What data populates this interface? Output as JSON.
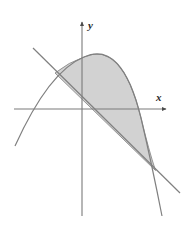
{
  "figure": {
    "background_color": "#ffffff",
    "axes": {
      "x_axis": {
        "label": "x",
        "label_position": {
          "x": 158,
          "y": 100
        },
        "start": {
          "x": 14,
          "y": 109
        },
        "end": {
          "x": 170,
          "y": 109
        },
        "arrow": "right",
        "color": "#7a7a7a"
      },
      "y_axis": {
        "label": "y",
        "label_position": {
          "x": 89,
          "y": 28
        },
        "start": {
          "x": 82,
          "y": 216
        },
        "end": {
          "x": 82,
          "y": 18
        },
        "arrow": "up",
        "color": "#7a7a7a"
      },
      "origin": {
        "x": 82,
        "y": 109
      }
    },
    "curves": [
      {
        "name": "parabola",
        "type": "quadratic",
        "orientation": "opens-down",
        "vertex": {
          "x": 84,
          "y": 57
        },
        "color": "#808080",
        "stroke_width": 1.1,
        "path": "M 15,146 Q 50,72 84,57 Q 122,40 141,118 Q 152,164 162,215",
        "x_intercepts": [
          30,
          135
        ]
      },
      {
        "name": "line",
        "type": "linear",
        "slope": "negative",
        "color": "#808080",
        "stroke_width": 1.1,
        "start": {
          "x": 33,
          "y": 48
        },
        "end": {
          "x": 180,
          "y": 193
        },
        "x_intercept": {
          "x": 95,
          "y": 109
        }
      }
    ],
    "shaded_region": {
      "name": "area-between-curves",
      "fill_color": "#d2d2d2",
      "outline_color": "#8a8a8a",
      "description": "Region enclosed between the parabola above and the line below",
      "path": "M 55,73 Q 70,62 84,57 Q 122,40 141,118 Q 149,151 155,170 L 55,73 Z"
    },
    "intersections": [
      {
        "name": "upper-left-intersection",
        "x": 55,
        "y": 73
      },
      {
        "name": "lower-right-intersection",
        "x": 155,
        "y": 170
      }
    ]
  }
}
